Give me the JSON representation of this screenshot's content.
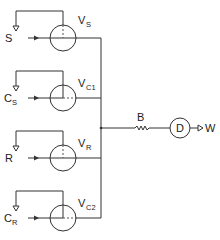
{
  "diagram": {
    "type": "flow schematic",
    "valves": [
      {
        "id": "VS",
        "label_main": "V",
        "label_sub": "S",
        "input": "S",
        "input_sub": "",
        "cy": 38
      },
      {
        "id": "VC1",
        "label_main": "V",
        "label_sub": "C1",
        "input": "C",
        "input_sub": "S",
        "cy": 98
      },
      {
        "id": "VR",
        "label_main": "V",
        "label_sub": "R",
        "input": "R",
        "input_sub": "",
        "cy": 158
      },
      {
        "id": "VC2",
        "label_main": "V",
        "label_sub": "C2",
        "input": "C",
        "input_sub": "R",
        "cy": 218
      }
    ],
    "resistor_label": "B",
    "detector_label": "D",
    "output_label": "W",
    "line_color": "#333333"
  }
}
